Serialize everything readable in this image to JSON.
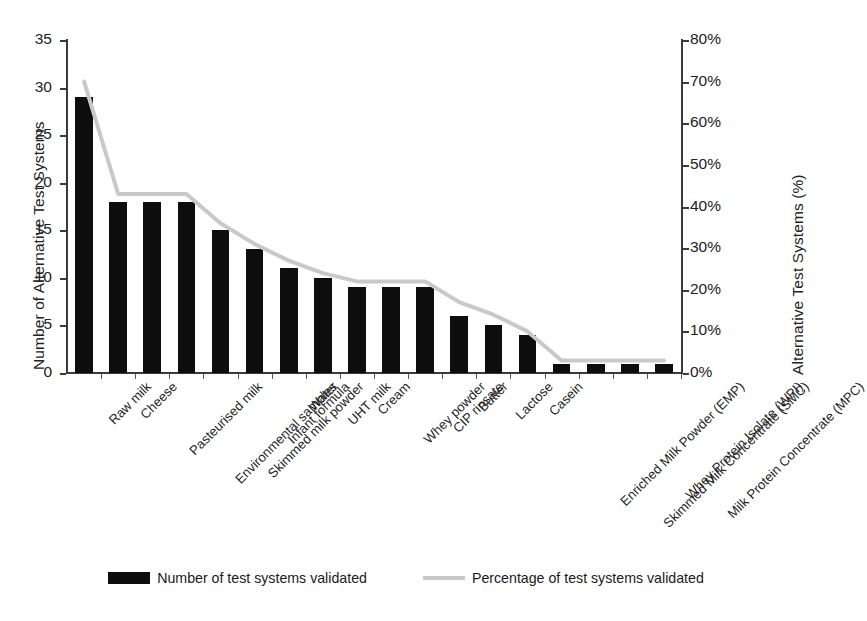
{
  "chart_data": {
    "type": "bar",
    "title": "",
    "xlabel": "",
    "ylabel": "Number of Alternative Test Systems",
    "y2label": "Alternative Test Systems (%)",
    "ylim": [
      0,
      35
    ],
    "y2lim": [
      0,
      80
    ],
    "yticks": [
      "0",
      "5",
      "10",
      "15",
      "20",
      "25",
      "30",
      "35"
    ],
    "ytick_values": [
      0,
      5,
      10,
      15,
      20,
      25,
      30,
      35
    ],
    "y2ticks": [
      "0%",
      "10%",
      "20%",
      "30%",
      "40%",
      "50%",
      "60%",
      "70%",
      "80%"
    ],
    "y2tick_values": [
      0,
      10,
      20,
      30,
      40,
      50,
      60,
      70,
      80
    ],
    "grid": false,
    "legend_position": "bottom",
    "categories": [
      "Raw milk",
      "Cheese",
      "Pasteurised milk",
      "Environmental samples",
      "Skimmed milk powder",
      "Infant formula",
      "Water",
      "UHT milk",
      "Cream",
      "Whey powder",
      "CIP rinsate",
      "Butter",
      "Lactose",
      "Casein",
      "Enriched Milk Powder (EMP)",
      "Skimmed Milk Concentrate (SMC)",
      "Whey Protein Isolate (WPI)",
      "Milk Protein Concentrate (MPC)"
    ],
    "series": [
      {
        "name": "Number of test systems validated",
        "type": "bar",
        "axis": "left",
        "color": "#0d0d0d",
        "values": [
          29,
          18,
          18,
          18,
          15,
          13,
          11,
          10,
          9,
          9,
          9,
          6,
          5,
          4,
          1,
          1,
          1,
          1
        ]
      },
      {
        "name": "Percentage of test systems validated",
        "type": "line",
        "axis": "right",
        "color": "#c9c9c9",
        "values": [
          70,
          43,
          43,
          43,
          36,
          31,
          27,
          24,
          22,
          22,
          22,
          17,
          14,
          10,
          3,
          3,
          3,
          3
        ]
      }
    ]
  },
  "legend": {
    "items": [
      {
        "label": "Number of test systems validated",
        "swatch": "bar"
      },
      {
        "label": "Percentage of test systems validated",
        "swatch": "line"
      }
    ]
  },
  "caption": {
    "text": ""
  }
}
